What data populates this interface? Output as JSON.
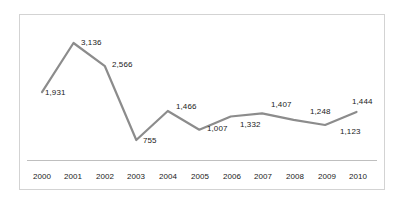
{
  "chart_data": {
    "type": "line",
    "title": "",
    "subtitle": "",
    "xlabel": "",
    "ylabel": "",
    "grid": false,
    "legend": false,
    "legend_position": "none",
    "series_color": "#8c8c8c",
    "label_color": "#1a1a1a",
    "border_color": "#d3d3d3",
    "axis_color": "#bfbfbf",
    "categories": [
      "2000",
      "2001",
      "2002",
      "2003",
      "2004",
      "2005",
      "2006",
      "2007",
      "2008",
      "2009",
      "2010"
    ],
    "values": [
      1931,
      3136,
      2566,
      755,
      1466,
      1007,
      1332,
      1407,
      1248,
      1123,
      1444
    ],
    "value_labels": [
      "1,931",
      "3,136",
      "2,566",
      "755",
      "1,466",
      "1,007",
      "1,332",
      "1,407",
      "1,248",
      "1,123",
      "1,444"
    ],
    "ylim": [
      0,
      3400
    ],
    "series": [
      {
        "name": "",
        "values": [
          1931,
          3136,
          2566,
          755,
          1466,
          1007,
          1332,
          1407,
          1248,
          1123,
          1444
        ]
      }
    ]
  },
  "axis": {
    "tick_labels": [
      "2000",
      "2001",
      "2002",
      "2003",
      "2004",
      "2005",
      "2006",
      "2007",
      "2008",
      "2009",
      "2010"
    ]
  },
  "labels": {
    "items": [
      "1,931",
      "3,136",
      "2,566",
      "755",
      "1,466",
      "1,007",
      "1,332",
      "1,407",
      "1,248",
      "1,123",
      "1,444"
    ]
  }
}
